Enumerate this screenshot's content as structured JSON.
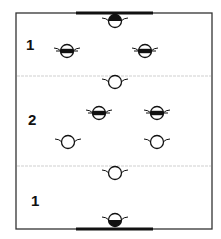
{
  "diagram": {
    "type": "field-formation",
    "colors": {
      "outline": "#333333",
      "goal": "#111111",
      "divider": "#cfcfcf",
      "player_stroke": "#111111",
      "player_fill": "#ffffff",
      "player_mark": "#111111"
    },
    "field": {
      "x": 16,
      "y": 13,
      "width": 196,
      "height": 216
    },
    "goals": [
      {
        "position": "top",
        "x1": 76,
        "x2": 153,
        "y": 13
      },
      {
        "position": "bottom",
        "x1": 76,
        "x2": 153,
        "y": 229
      }
    ],
    "dividers": [
      {
        "y": 76
      },
      {
        "y": 166
      }
    ],
    "zones": [
      {
        "label": "1",
        "x": 26,
        "y": 37
      },
      {
        "label": "2",
        "x": 28,
        "y": 112
      },
      {
        "label": "1",
        "x": 31,
        "y": 193
      }
    ],
    "players": [
      {
        "id": "goalkeeper-top",
        "x": 115,
        "y": 21,
        "style": "half-top"
      },
      {
        "id": "player-a1",
        "x": 67,
        "y": 51,
        "style": "band"
      },
      {
        "id": "player-a2",
        "x": 145,
        "y": 51,
        "style": "band"
      },
      {
        "id": "player-b1",
        "x": 115,
        "y": 82,
        "style": "open"
      },
      {
        "id": "player-a3",
        "x": 99,
        "y": 113,
        "style": "band"
      },
      {
        "id": "player-a4",
        "x": 157,
        "y": 113,
        "style": "band"
      },
      {
        "id": "player-b2",
        "x": 68,
        "y": 142,
        "style": "open"
      },
      {
        "id": "player-b3",
        "x": 157,
        "y": 142,
        "style": "open"
      },
      {
        "id": "player-b4",
        "x": 115,
        "y": 173,
        "style": "open"
      },
      {
        "id": "goalkeeper-bottom",
        "x": 115,
        "y": 220,
        "style": "half-bottom"
      }
    ]
  }
}
